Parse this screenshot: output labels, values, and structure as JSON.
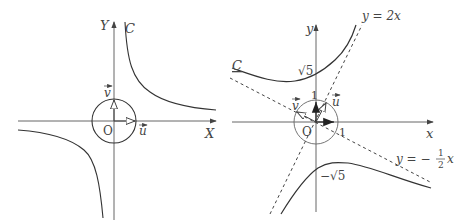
{
  "left_panel": {
    "axis_x_label": "X",
    "axis_y_label": "Y",
    "curve_label": "C",
    "origin_label": "O",
    "vector_u_label": "u",
    "vector_v_label": "v"
  },
  "right_panel": {
    "axis_x_label": "x",
    "axis_y_label": "y",
    "curve_label": "C",
    "origin_label": "O",
    "vector_u_label": "u",
    "vector_v_label": "v",
    "tick_x_label": "1",
    "tick_y_label": "1",
    "upper_intercept_label": "√5",
    "lower_intercept_label": "−√5",
    "asymptote1_label": "y = 2x",
    "asymptote2_label_prefix": "y = −",
    "asymptote2_frac_num": "1",
    "asymptote2_frac_den": "2",
    "asymptote2_label_suffix": "x"
  },
  "colors": {
    "stroke": "#3a3a3a",
    "axis": "#555555",
    "text": "#444444"
  }
}
